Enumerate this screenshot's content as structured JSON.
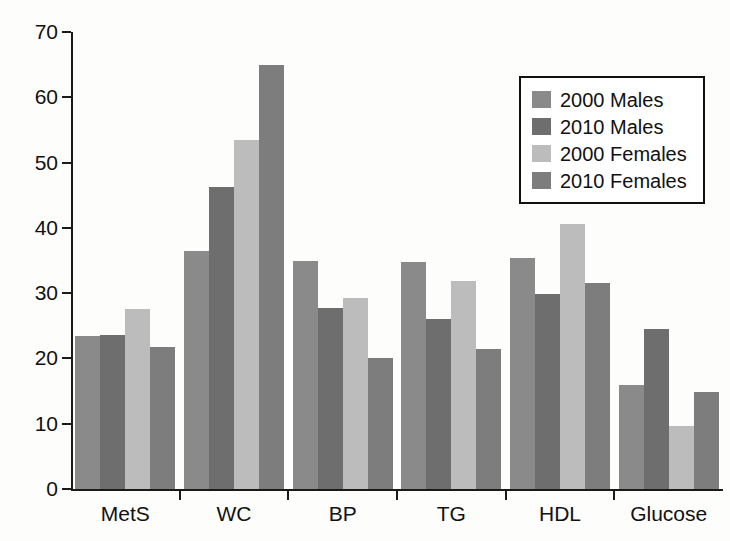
{
  "chart_data": {
    "type": "bar",
    "title": "",
    "xlabel": "",
    "ylabel": "",
    "ylim": [
      0,
      70
    ],
    "yticks": [
      0,
      10,
      20,
      30,
      40,
      50,
      60,
      70
    ],
    "grid": false,
    "legend_position": "upper-right",
    "categories": [
      "MetS",
      "WC",
      "BP",
      "TG",
      "HDL",
      "Glucose"
    ],
    "series": [
      {
        "name": "2000 Males",
        "color": "#8a8a8a",
        "values": [
          23.5,
          36.5,
          35.0,
          34.8,
          35.4,
          16.0
        ]
      },
      {
        "name": "2010 Males",
        "color": "#6e6e6e",
        "values": [
          23.6,
          46.3,
          27.7,
          26.1,
          29.8,
          24.5
        ]
      },
      {
        "name": "2000 Females",
        "color": "#bcbcbc",
        "values": [
          27.5,
          53.4,
          29.2,
          31.8,
          40.6,
          9.7
        ]
      },
      {
        "name": "2010 Females",
        "color": "#7d7d7d",
        "values": [
          21.8,
          65.0,
          20.0,
          21.4,
          31.6,
          14.8
        ]
      }
    ]
  },
  "axis": {
    "y_tick_labels": [
      "0",
      "10",
      "20",
      "30",
      "40",
      "50",
      "60",
      "70"
    ],
    "x_tick_labels": [
      "MetS",
      "WC",
      "BP",
      "TG",
      "HDL",
      "Glucose"
    ]
  },
  "legend": {
    "items": [
      {
        "label": "2000 Males",
        "swatch": "#8a8a8a"
      },
      {
        "label": "2010 Males",
        "swatch": "#6e6e6e"
      },
      {
        "label": "2000 Females",
        "swatch": "#bcbcbc"
      },
      {
        "label": "2010 Females",
        "swatch": "#7d7d7d"
      }
    ]
  }
}
